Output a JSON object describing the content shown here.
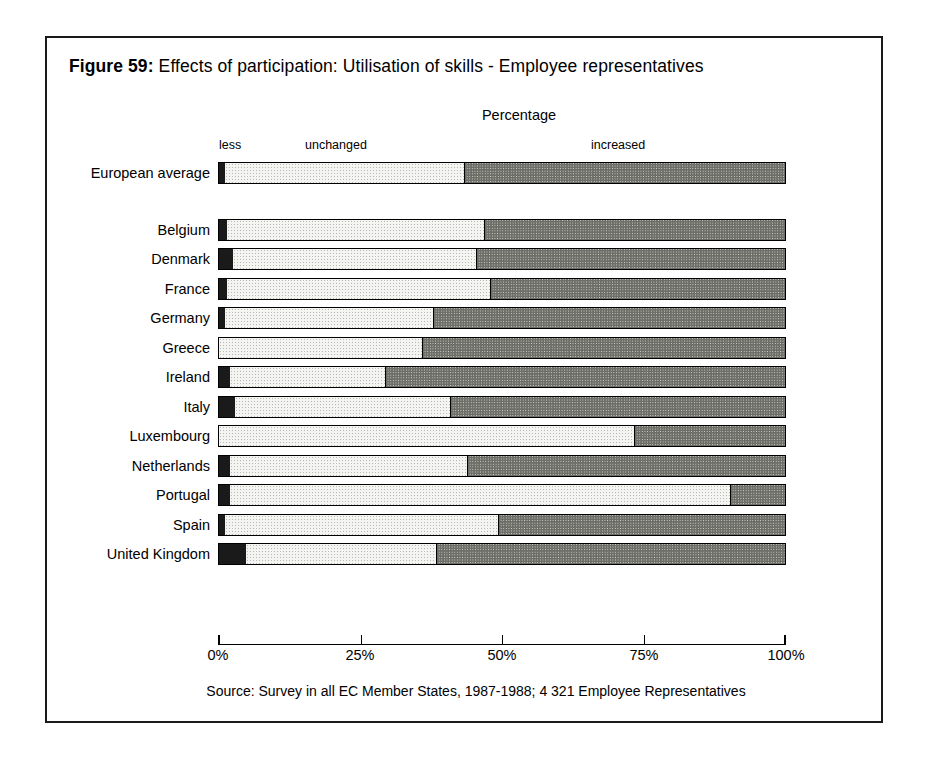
{
  "figure": {
    "number_label": "Figure 59:",
    "title": "Effects of participation: Utilisation of skills - Employee representatives",
    "axis_title": "Percentage",
    "source": "Source: Survey in all EC Member States, 1987-1988; 4 321 Employee Representatives"
  },
  "legend": {
    "less": "less",
    "unchanged": "unchanged",
    "increased": "increased"
  },
  "axis": {
    "ticks": [
      "0%",
      "25%",
      "50%",
      "75%",
      "100%"
    ]
  },
  "chart_data": {
    "type": "bar",
    "orientation": "horizontal",
    "stacked": true,
    "title": "Effects of participation: Utilisation of skills - Employee representatives",
    "xlabel": "Percentage",
    "ylabel": "",
    "xlim": [
      0,
      100
    ],
    "xtick_labels": [
      "0%",
      "25%",
      "50%",
      "75%",
      "100%"
    ],
    "xticks": [
      0,
      25,
      50,
      75,
      100
    ],
    "grid": false,
    "legend_position": "top-inline",
    "categories": [
      "European average",
      "Belgium",
      "Denmark",
      "France",
      "Germany",
      "Greece",
      "Ireland",
      "Italy",
      "Luxembourg",
      "Netherlands",
      "Portugal",
      "Spain",
      "United Kingdom"
    ],
    "series": [
      {
        "name": "less",
        "color": "#1a1a1a",
        "values": [
          1.0,
          1.5,
          2.5,
          1.5,
          1.0,
          0.0,
          2.0,
          2.8,
          0.0,
          2.0,
          2.0,
          1.0,
          4.8
        ]
      },
      {
        "name": "unchanged",
        "color": "#f4f4f2",
        "values": [
          42.5,
          45.5,
          43.0,
          46.5,
          37.0,
          36.0,
          27.5,
          38.2,
          73.5,
          42.0,
          88.5,
          48.5,
          33.7
        ]
      },
      {
        "name": "increased",
        "color": "#dcdcd8",
        "values": [
          56.5,
          53.0,
          54.5,
          52.0,
          62.0,
          64.0,
          70.5,
          59.0,
          26.5,
          56.0,
          9.5,
          50.5,
          61.5
        ]
      }
    ],
    "rows": [
      {
        "label": "European average",
        "gap_after": true,
        "less": 1.0,
        "unchanged": 42.5,
        "increased": 56.5
      },
      {
        "label": "Belgium",
        "gap_after": false,
        "less": 1.5,
        "unchanged": 45.5,
        "increased": 53.0
      },
      {
        "label": "Denmark",
        "gap_after": false,
        "less": 2.5,
        "unchanged": 43.0,
        "increased": 54.5
      },
      {
        "label": "France",
        "gap_after": false,
        "less": 1.5,
        "unchanged": 46.5,
        "increased": 52.0
      },
      {
        "label": "Germany",
        "gap_after": false,
        "less": 1.0,
        "unchanged": 37.0,
        "increased": 62.0
      },
      {
        "label": "Greece",
        "gap_after": false,
        "less": 0.0,
        "unchanged": 36.0,
        "increased": 64.0
      },
      {
        "label": "Ireland",
        "gap_after": false,
        "less": 2.0,
        "unchanged": 27.5,
        "increased": 70.5
      },
      {
        "label": "Italy",
        "gap_after": false,
        "less": 2.8,
        "unchanged": 38.2,
        "increased": 59.0
      },
      {
        "label": "Luxembourg",
        "gap_after": false,
        "less": 0.0,
        "unchanged": 73.5,
        "increased": 26.5
      },
      {
        "label": "Netherlands",
        "gap_after": false,
        "less": 2.0,
        "unchanged": 42.0,
        "increased": 56.0
      },
      {
        "label": "Portugal",
        "gap_after": false,
        "less": 2.0,
        "unchanged": 88.5,
        "increased": 9.5
      },
      {
        "label": "Spain",
        "gap_after": false,
        "less": 1.0,
        "unchanged": 48.5,
        "increased": 50.5
      },
      {
        "label": "United Kingdom",
        "gap_after": false,
        "less": 4.8,
        "unchanged": 33.7,
        "increased": 61.5
      }
    ]
  }
}
